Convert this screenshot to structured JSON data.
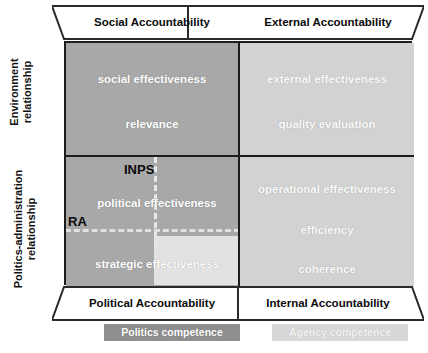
{
  "axes": {
    "vertical_top": {
      "line1": "Environment",
      "line2": "relationship"
    },
    "vertical_bottom": {
      "line1": "Politics-administration",
      "line2": "relationship"
    }
  },
  "bands": {
    "top_left": "Social Accountability",
    "top_right": "External Accountability",
    "bottom_left": "Political Accountability",
    "bottom_right": "Internal Accountability"
  },
  "quadrants": {
    "top_left": {
      "name": "social-accountability-quadrant",
      "fill": "#a8a8a8",
      "items": [
        "social effectiveness",
        "relevance"
      ]
    },
    "top_right": {
      "name": "external-accountability-quadrant",
      "fill": "#d2d2d2",
      "items": [
        "external effectiveness",
        "quality evaluation"
      ]
    },
    "bottom_left": {
      "name": "political-accountability-quadrant",
      "fill": "#a8a8a8",
      "items": [
        "political effectiveness",
        "strategic effectiveness"
      ],
      "markers": [
        "INPS",
        "RA"
      ]
    },
    "bottom_right": {
      "name": "internal-accountability-quadrant",
      "fill": "#d2d2d2",
      "items": [
        "operational effectiveness",
        "efficiency",
        "coherence"
      ]
    }
  },
  "legend": {
    "politics": "Politics competence",
    "agency": "Agency competence",
    "politics_color": "#8f8f8f",
    "agency_color": "#d8d8d8"
  }
}
